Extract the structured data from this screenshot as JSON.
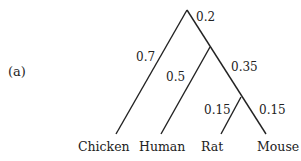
{
  "panel_label": "(a)",
  "tree": {
    "branch_lengths": {
      "root": "0.2",
      "chicken": "0.7",
      "human": "0.5",
      "rat_mouse_ancestor": "0.35",
      "rat": "0.15",
      "mouse": "0.15"
    },
    "leaves": [
      "Chicken",
      "Human",
      "Rat",
      "Mouse"
    ]
  },
  "colors": {
    "line": "#222222",
    "text": "#222222"
  }
}
